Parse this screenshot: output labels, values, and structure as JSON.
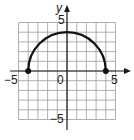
{
  "chart_data": {
    "type": "line",
    "title": "",
    "xlabel": "",
    "ylabel": "y",
    "xlim": [
      -5,
      5
    ],
    "ylim": [
      -5,
      5
    ],
    "grid": true,
    "grid_step": 1,
    "tick_labels": {
      "x_min": "−5",
      "x_max": "5",
      "y_max": "5",
      "y_min": "−5",
      "origin": "0"
    },
    "series": [
      {
        "name": "upper semicircle y = sqrt(16 - x^2)",
        "center": [
          0,
          0
        ],
        "radius": 4,
        "x": [
          -4,
          -3,
          -2,
          -1,
          0,
          1,
          2,
          3,
          4
        ],
        "y": [
          0,
          2.65,
          3.46,
          3.87,
          4,
          3.87,
          3.46,
          2.65,
          0
        ],
        "endpoints": [
          {
            "x": -4,
            "y": 0,
            "style": "closed"
          },
          {
            "x": 4,
            "y": 0,
            "style": "closed"
          }
        ]
      }
    ]
  },
  "labels": {
    "y_axis": "y",
    "x_neg": "−5",
    "x_pos": "5",
    "y_pos": "5",
    "y_neg": "−5",
    "origin": "0"
  },
  "colors": {
    "grid": "#9a9a9a",
    "axis": "#1a1a1a",
    "curve": "#111111"
  }
}
